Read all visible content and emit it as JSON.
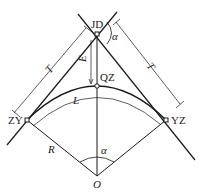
{
  "diagram": {
    "type": "circular-curve-elements",
    "points": {
      "jd": "JD",
      "qz": "QZ",
      "zy": "ZY",
      "yz": "YZ",
      "o": "O"
    },
    "labels": {
      "tangent_left": "T",
      "tangent_right": "T",
      "external_distance": "E",
      "curve_length": "L",
      "radius": "R",
      "deflection_angle_top": "α",
      "central_angle": "α"
    },
    "colors": {
      "line": "#1a1a1a",
      "background": "#ffffff"
    }
  }
}
